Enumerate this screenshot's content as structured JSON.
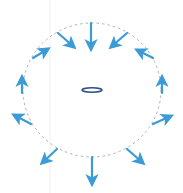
{
  "diagram": {
    "width": 183,
    "height": 193,
    "background": "#ffffff",
    "guide_line": {
      "x": 50,
      "color": "#eef0f2"
    },
    "circle": {
      "cx": 92,
      "cy": 90,
      "rx": 69,
      "ry": 67,
      "stroke": "#b0b0b0",
      "dash": "2.5 3"
    },
    "center_ellipse": {
      "cx": 92,
      "cy": 90,
      "rx": 10,
      "ry": 2.2,
      "stroke": "#2f4e8a",
      "stroke_width": 1.6
    },
    "arrow_color": "#3a9bd6",
    "arrows": [
      {
        "name": "arrow-top",
        "x1": 91,
        "y1": 23,
        "x2": 91,
        "y2": 49
      },
      {
        "name": "arrow-top-left",
        "x1": 58,
        "y1": 33,
        "x2": 74,
        "y2": 47
      },
      {
        "name": "arrow-top-right",
        "x1": 127,
        "y1": 33,
        "x2": 111,
        "y2": 47
      },
      {
        "name": "arrow-left-upper",
        "x1": 33,
        "y1": 58,
        "x2": 48,
        "y2": 49
      },
      {
        "name": "arrow-right-upper",
        "x1": 153,
        "y1": 58,
        "x2": 137,
        "y2": 50
      },
      {
        "name": "arrow-left-middle",
        "x1": 22,
        "y1": 93,
        "x2": 22,
        "y2": 77
      },
      {
        "name": "arrow-right-middle",
        "x1": 162,
        "y1": 93,
        "x2": 162,
        "y2": 77
      },
      {
        "name": "arrow-left-lower",
        "x1": 31,
        "y1": 124,
        "x2": 14,
        "y2": 115
      },
      {
        "name": "arrow-right-lower",
        "x1": 153,
        "y1": 124,
        "x2": 171,
        "y2": 116
      },
      {
        "name": "arrow-bottom-left",
        "x1": 57,
        "y1": 149,
        "x2": 42,
        "y2": 163
      },
      {
        "name": "arrow-bottom",
        "x1": 92,
        "y1": 157,
        "x2": 92,
        "y2": 184
      },
      {
        "name": "arrow-bottom-right",
        "x1": 127,
        "y1": 149,
        "x2": 143,
        "y2": 163
      }
    ]
  }
}
